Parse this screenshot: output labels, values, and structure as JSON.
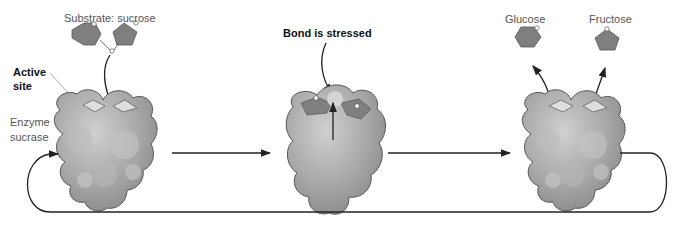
{
  "labels": {
    "substrate": "Substrate: sucrose",
    "active_site_line1": "Active",
    "active_site_line2": "site",
    "enzyme_line1": "Enzyme",
    "enzyme_line2": "sucrase",
    "bond_stressed": "Bond is stressed",
    "glucose": "Glucose",
    "fructose": "Fructose"
  },
  "stages": [
    {
      "name": "substrate-binding",
      "description": "Sucrose enters active site of sucrase"
    },
    {
      "name": "bond-stressed",
      "description": "Bond between glucose and fructose is stressed"
    },
    {
      "name": "products-released",
      "description": "Glucose and fructose released; enzyme recycled"
    }
  ],
  "colors": {
    "enzyme_fill": "#a9a9a9",
    "sugar_fill": "#7f7f7f",
    "active_site_fill": "#dedede",
    "arrow": "#222222",
    "text": "#555555"
  }
}
